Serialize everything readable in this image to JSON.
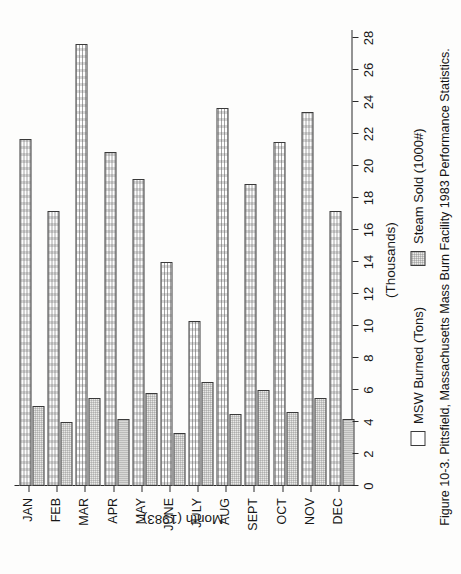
{
  "figure": {
    "caption": "Figure 10-3. Pittsfield, Massachusetts Mass Burn Facility 1983 Performance Statistics.",
    "caption_number": "Figure 10-3."
  },
  "legend": {
    "position": "below-plot",
    "items": [
      {
        "label": "MSW Burned (Tons)",
        "swatch": "msw",
        "color": "#fefefe"
      },
      {
        "label": "Steam Sold (1000#)",
        "swatch": "steam",
        "color": "#e9e9e7"
      }
    ]
  },
  "axes": {
    "value_axis_title": "(Thousands)",
    "category_axis_title": "Month (1983)",
    "value_ticks": [
      "0",
      "2",
      "4",
      "6",
      "8",
      "10",
      "12",
      "14",
      "16",
      "18",
      "20",
      "22",
      "24",
      "26",
      "28"
    ],
    "value_tick_values": [
      0,
      2,
      4,
      6,
      8,
      10,
      12,
      14,
      16,
      18,
      20,
      22,
      24,
      26,
      28
    ],
    "value_range": [
      0,
      28.5
    ],
    "grid": false
  },
  "chart_data": {
    "type": "bar",
    "orientation": "horizontal",
    "title": "Pittsfield, Massachusetts Mass Burn Facility 1983 Performance Statistics",
    "xlabel": "(Thousands)",
    "ylabel": "Month (1983)",
    "xlim": [
      0,
      28.5
    ],
    "grid": false,
    "legend_position": "below",
    "categories": [
      "JAN",
      "FEB",
      "MAR",
      "APR",
      "MAY",
      "JUNE",
      "JULY",
      "AUG",
      "SEPT",
      "OCT",
      "NOV",
      "DEC"
    ],
    "series": [
      {
        "name": "MSW Burned (Tons)",
        "units": "thousands of tons",
        "values": [
          21.7,
          17.2,
          27.6,
          20.9,
          19.2,
          14.0,
          10.3,
          23.6,
          18.9,
          21.5,
          23.4,
          17.2
        ]
      },
      {
        "name": "Steam Sold (1000#)",
        "units": "thousands of 1000# units",
        "values": [
          5.0,
          4.0,
          5.5,
          4.2,
          5.8,
          3.3,
          6.5,
          4.5,
          6.0,
          4.6,
          5.5,
          4.2
        ]
      }
    ]
  }
}
